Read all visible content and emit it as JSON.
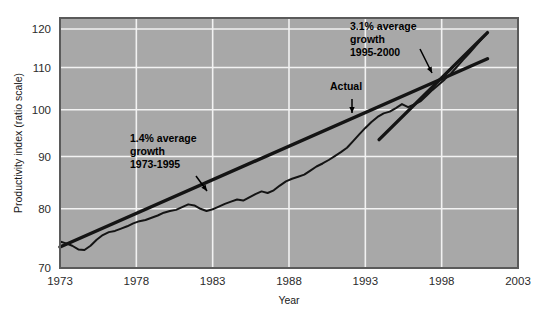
{
  "chart_data": {
    "type": "line",
    "title": "",
    "xlabel": "Year",
    "ylabel": "Productivity index (ratio scale)",
    "scale": "log",
    "grid": true,
    "legend_position": "none",
    "xlim": [
      1973,
      2003
    ],
    "ylim": [
      70,
      123
    ],
    "xticks": [
      1973,
      1978,
      1983,
      1988,
      1993,
      1998,
      2003
    ],
    "xtick_labels": [
      "1973",
      "1978",
      "1983",
      "1988",
      "1993",
      "1998",
      "2003"
    ],
    "yticks": [
      70,
      80,
      90,
      100,
      110,
      120
    ],
    "ytick_labels": [
      "70",
      "80",
      "90",
      "100",
      "110",
      "120"
    ],
    "series": [
      {
        "name": "Actual",
        "style": "jagged-line",
        "x": [
          1973.0,
          1973.4,
          1973.8,
          1974.2,
          1974.6,
          1975.0,
          1975.4,
          1975.8,
          1976.2,
          1976.6,
          1977.0,
          1977.4,
          1977.8,
          1978.2,
          1978.6,
          1979.0,
          1979.4,
          1979.8,
          1980.2,
          1980.6,
          1981.0,
          1981.4,
          1981.8,
          1982.2,
          1982.6,
          1983.0,
          1983.4,
          1983.8,
          1984.2,
          1984.6,
          1985.0,
          1985.4,
          1985.8,
          1986.2,
          1986.6,
          1987.0,
          1987.4,
          1987.8,
          1988.2,
          1988.6,
          1989.0,
          1989.4,
          1989.8,
          1990.2,
          1990.6,
          1991.0,
          1991.4,
          1991.8,
          1992.2,
          1992.6,
          1993.0,
          1993.4,
          1993.8,
          1994.2,
          1994.6,
          1995.0,
          1995.4,
          1995.8,
          1996.2,
          1996.6,
          1997.0,
          1997.4,
          1997.8,
          1998.2,
          1998.6,
          1999.0,
          1999.4,
          1999.8,
          2000.2,
          2000.6,
          2001.0
        ],
        "y": [
          74.3,
          74.0,
          73.6,
          73.0,
          72.9,
          73.6,
          74.6,
          75.4,
          75.9,
          76.1,
          76.5,
          76.9,
          77.4,
          77.8,
          78.0,
          78.4,
          78.8,
          79.3,
          79.6,
          79.8,
          80.3,
          80.8,
          80.6,
          80.0,
          79.6,
          79.9,
          80.4,
          80.9,
          81.3,
          81.7,
          81.5,
          82.1,
          82.7,
          83.2,
          82.9,
          83.4,
          84.3,
          85.1,
          85.6,
          86.0,
          86.4,
          87.2,
          88.0,
          88.6,
          89.3,
          90.1,
          90.9,
          91.8,
          93.2,
          94.6,
          96.0,
          97.3,
          98.4,
          99.2,
          99.6,
          100.4,
          101.3,
          100.6,
          101.2,
          101.9,
          103.2,
          104.6,
          105.8,
          107.1,
          108.5,
          110.2,
          111.9,
          113.6,
          115.4,
          117.2,
          119.0
        ],
        "color": "#141414",
        "linewidth": 2.0
      },
      {
        "name": "1.4% average growth trend 1973-1995",
        "style": "straight-trend",
        "x": [
          1973.0,
          2001.0
        ],
        "y": [
          73.4,
          112.2
        ],
        "annotation_growth_rate": "1.4%",
        "annotation_period": "1973-1995",
        "color": "#141414",
        "linewidth": 3.4
      },
      {
        "name": "3.1% average growth trend 1995-2000",
        "style": "straight-trend",
        "x": [
          1993.9,
          2001.0
        ],
        "y": [
          93.5,
          119.0
        ],
        "annotation_growth_rate": "3.1%",
        "annotation_period": "1995-2000",
        "color": "#141414",
        "linewidth": 3.4
      }
    ],
    "annotations": [
      {
        "id": "annot-growth-14",
        "lines": [
          "1.4% average",
          "growth",
          "1973-1995"
        ],
        "text_x_px": 130,
        "text_y_px": 142,
        "arrow_from_px": [
          196,
          176
        ],
        "arrow_to_px": [
          207,
          191
        ]
      },
      {
        "id": "annot-growth-31",
        "lines": [
          "3.1% average",
          "growth",
          "1995-2000"
        ],
        "text_x_px": 350,
        "text_y_px": 30,
        "arrow_from_px": [
          420,
          49
        ],
        "arrow_to_px": [
          432,
          73
        ]
      },
      {
        "id": "annot-actual",
        "lines": [
          "Actual"
        ],
        "text_x_px": 330,
        "text_y_px": 90,
        "arrow_from_px": [
          352,
          99
        ],
        "arrow_to_px": [
          352,
          113
        ]
      }
    ],
    "colors": {
      "plot_background": "#a8a8a8",
      "gridline": "#f2f2f2",
      "plot_border": "#5a5a5a",
      "series_line": "#141414",
      "tick_label": "#2b2b2b",
      "axis_title": "#1a1a1a",
      "page_background": "#ffffff"
    }
  }
}
